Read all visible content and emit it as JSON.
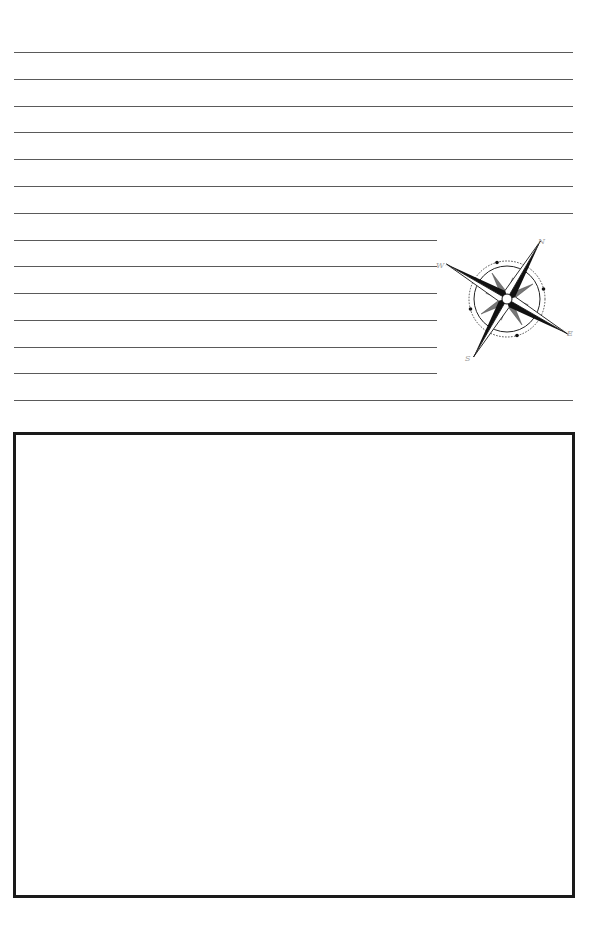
{
  "page": {
    "type": "journal-page",
    "background_color": "#ffffff"
  },
  "writing_lines": {
    "color": "#5a5a5a",
    "full_width_lines_top": [
      52,
      79,
      106,
      132,
      159,
      186,
      213
    ],
    "short_lines": [
      240,
      266,
      293,
      320,
      347,
      373
    ],
    "full_width_line_bottom": [
      400
    ]
  },
  "compass": {
    "icon": "compass-rose-icon",
    "labels": {
      "north": "N",
      "east": "E",
      "south": "S",
      "west": "W"
    },
    "ink_color": "#111111",
    "label_color": "#9a9a9a"
  },
  "drawing_box": {
    "border_color": "#1a1a1a",
    "content": ""
  }
}
